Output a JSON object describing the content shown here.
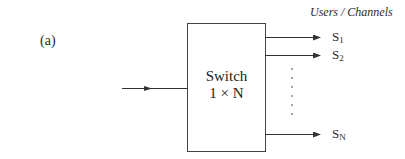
{
  "figure_label": "(a)",
  "header": "Users / Channels",
  "switch": {
    "title": "Switch",
    "subtitle": "1 × N"
  },
  "input": {
    "label": ""
  },
  "outputs": [
    {
      "name": "S",
      "sub": "1"
    },
    {
      "name": "S",
      "sub": "2"
    },
    {
      "name": "S",
      "sub": "N"
    }
  ],
  "ellipsis_dots": 7,
  "colors": {
    "line": "#333333",
    "text": "#2a2a2a",
    "background": "#ffffff"
  }
}
